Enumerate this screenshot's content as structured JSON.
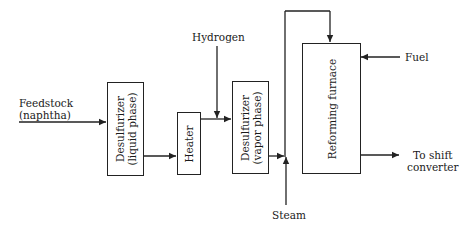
{
  "diagram": {
    "type": "process-flow",
    "inputs": {
      "feedstock": {
        "line1": "Feedstock",
        "line2": "(naphtha)"
      },
      "hydrogen": "Hydrogen",
      "steam": "Steam",
      "fuel": "Fuel"
    },
    "units": {
      "desulfurizer_liquid": {
        "line1": "Desulfurizer",
        "line2": "(liquid phase)"
      },
      "heater": "Heater",
      "desulfurizer_vapor": {
        "line1": "Desulfurizer",
        "line2": "(vapor phase)"
      },
      "reforming_furnace": "Reforming furnace"
    },
    "outputs": {
      "shift": {
        "line1": "To shift",
        "line2": "converter"
      }
    },
    "flow": [
      "Feedstock (naphtha) -> Desulfurizer (liquid phase)",
      "Desulfurizer (liquid phase) -> Heater",
      "Heater + Hydrogen -> Desulfurizer (vapor phase)",
      "Desulfurizer (vapor phase) + Steam -> Reforming furnace (top inlet)",
      "Fuel -> Reforming furnace",
      "Reforming furnace -> To shift converter"
    ],
    "colors": {
      "line": "#222222",
      "background": "#ffffff"
    }
  }
}
